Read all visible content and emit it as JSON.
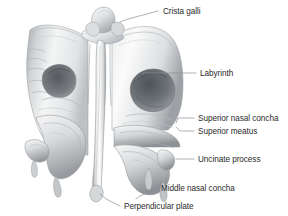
{
  "figure": {
    "background_color": "#ffffff",
    "label_color": "#2b2b2b",
    "leader_color": "#8a8f94",
    "bone_light": "#fdfdfd",
    "bone_mid": "#d9dadc",
    "bone_shadow": "#8e9296",
    "cavity_dark": "#5f6468"
  },
  "labels": [
    {
      "id": "crista-galli",
      "text": "Crista galli",
      "x": 163,
      "y": 14,
      "anchor": "start",
      "leader": "M 158 11 L 128 19 L 120 22"
    },
    {
      "id": "labyrinth",
      "text": "Labyrinth",
      "x": 200,
      "y": 76,
      "anchor": "start",
      "leader": "M 196 73 L 143 73"
    },
    {
      "id": "superior-nasal-concha",
      "text": "Superior nasal concha",
      "x": 198,
      "y": 121,
      "anchor": "start",
      "leader": "M 194 118 L 178 118 L 176 123"
    },
    {
      "id": "superior-meatus",
      "text": "Superior meatus",
      "x": 198,
      "y": 134,
      "anchor": "start",
      "leader": "M 194 131 L 180 131 L 176 127"
    },
    {
      "id": "uncinate-process",
      "text": "Uncinate process",
      "x": 198,
      "y": 162,
      "anchor": "start",
      "leader": "M 194 159 L 176 159"
    },
    {
      "id": "middle-nasal-concha",
      "text": "Middle nasal concha",
      "x": 161,
      "y": 191,
      "anchor": "start",
      "leader": "M 157 188 L 140 196 L 136 199"
    },
    {
      "id": "perpendicular-plate",
      "text": "Perpendicular plate",
      "x": 124,
      "y": 209,
      "anchor": "start",
      "leader": "M 120 206 L 106 199 L 100 194"
    }
  ],
  "anatomy": {
    "parts": [
      {
        "id": "crista-galli-knob",
        "name": "Crista galli"
      },
      {
        "id": "cribriform-plate",
        "name": "Cribriform plate"
      },
      {
        "id": "left-labyrinth",
        "name": "Left labyrinth"
      },
      {
        "id": "right-labyrinth",
        "name": "Right labyrinth"
      },
      {
        "id": "perpendicular-plate-blade",
        "name": "Perpendicular plate"
      },
      {
        "id": "left-middle-concha",
        "name": "Left middle nasal concha"
      },
      {
        "id": "right-middle-concha",
        "name": "Right middle nasal concha"
      },
      {
        "id": "left-uncinate",
        "name": "Left uncinate process"
      },
      {
        "id": "right-uncinate",
        "name": "Right uncinate process"
      }
    ]
  }
}
